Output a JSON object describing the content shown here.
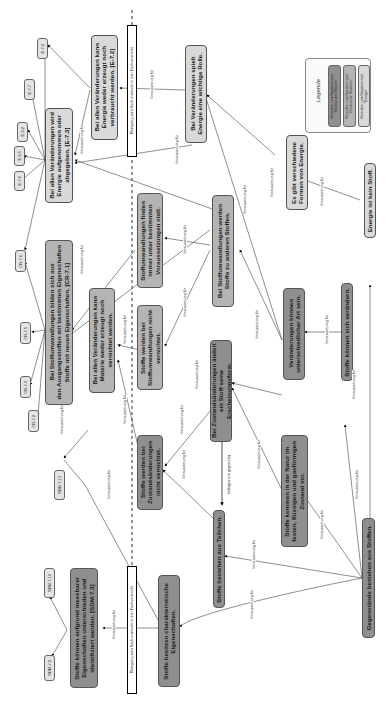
{
  "diagram": {
    "type": "concept-map",
    "orientation": "rotated-90",
    "edge_label": "Voraussetzung für",
    "mutual_label": "bedingen sich gegenseitig",
    "transition_label": "Übergang vom Sachunterricht in den Fachunterricht"
  },
  "colors": {
    "struktur_der_materie": "#8f8f8f",
    "chemische_reaktion": "#b4b4b4",
    "energie": "#d9d9d9",
    "code_box": "#e4e4e4"
  },
  "legend": {
    "title": "Legende",
    "items": [
      {
        "label": "Kernidee zum Basiskonzept\n\"Struktur der Materie\""
      },
      {
        "label": "Kernidee zum Basiskonzept\n\"Chemische Reaktion\""
      },
      {
        "label": "Kernidee zum Basiskonzept\n\"Energie\""
      }
    ]
  },
  "nodes": {
    "n1": "Gegenstände bestehen aus Stoffen.",
    "n2": "Stoffe besitzen charakteristische\nEigenschaften.",
    "n3": "Stoffe können aufgrund messbarer\nEigenschaften unterschieden und\nidentifiziert werden. [SDM-7.3]",
    "n4": "Stoffe bestehen aus Teilchen.",
    "n5": "Stoffe werden bei\nZustandsänderungen\nnicht vernichtet.",
    "n6": "Bei Zustandsänderungen ändert\nein Stoff seine Erscheinungsform.",
    "n7": "Stoffe kommen in der Natur im\nfesten, flüssigen und gasförmigen\nZustand vor.",
    "n8": "Stoffe können sich verändern.",
    "n9": "Veränderungen können\nunterschiedlicher Art sein.",
    "n10": "Stoffe werden bei\nStoffumwandlungen nicht\nvernichtet.",
    "n11": "Bei allen Veränderungen kann\nMaterie weder erzeugt noch\nvernichtet werden.",
    "n12": "Bei Stoffumwandlungen bilden sich aus\nden Ausgangsstoffen mit bestimmten Eigenschaften\nStoffe mit neuen Eigenschaften. [CR-7.1]",
    "n13": "Stoffumwandlungen finden\nimmer unter bestimmten\nVoraussetzungen statt.",
    "n14": "Bei Stoffumwandlungen werden\nStoffe zu anderen Stoffen.",
    "n15": "Bei allen Veränderungen wird\nEnergie aufgenommen oder\nabgegeben. [E-7.3]",
    "n16": "Bei allen Veränderungen kann\nEnergie weder erzeugt noch\nverbraucht werden. [E-7.2]",
    "n17": "Bei Veränderungen spielt\nEnergie eine wichtige Rolle.",
    "n18": "Es gibt verschiedene\nFormen von Energie.",
    "n19": "Energie ist kein Stoff."
  },
  "codes": {
    "c1": "E-7.4",
    "c2": "E-7.7",
    "c3": "E-9.2",
    "c4": "E-9.5",
    "c5": "E-7.6",
    "c6": "CR-7.6",
    "c7": "CR-7.5",
    "c8": "CR-7.3",
    "c9": "CR-7.2",
    "c10": "SDM-7.13",
    "c11": "SDM-7.10",
    "c12": "SDM-7.4"
  }
}
